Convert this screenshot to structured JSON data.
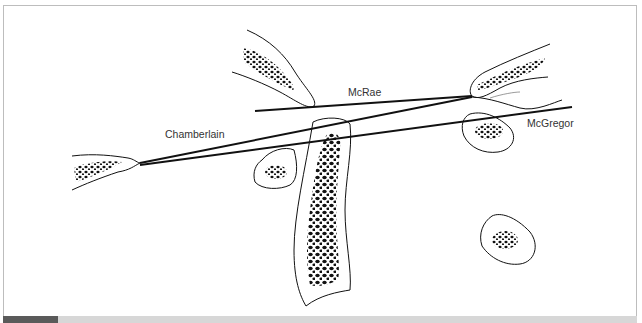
{
  "diagram": {
    "type": "radiographic reference lines of the craniovertebral junction",
    "labels": {
      "mcrae": "McRae",
      "chamberlain": "Chamberlain",
      "mcgregor": "McGregor"
    },
    "lines": [
      {
        "name": "McRae",
        "from": [
          255,
          111
        ],
        "to": [
          472,
          96
        ]
      },
      {
        "name": "Chamberlain",
        "from": [
          140,
          163
        ],
        "to": [
          472,
          97
        ]
      },
      {
        "name": "McGregor",
        "from": [
          140,
          165
        ],
        "to": [
          572,
          107
        ]
      }
    ],
    "structures": [
      "hard-palate",
      "clivus",
      "opisthion",
      "anterior-arch-atlas",
      "dens-axis",
      "posterior-arch-atlas",
      "occipital-bone",
      "spinous-process"
    ]
  },
  "colors": {
    "line": "#111111",
    "frame": "#bdbdbd",
    "bar_dark": "#5a5a5a",
    "bar_light": "#d7d7d7"
  }
}
